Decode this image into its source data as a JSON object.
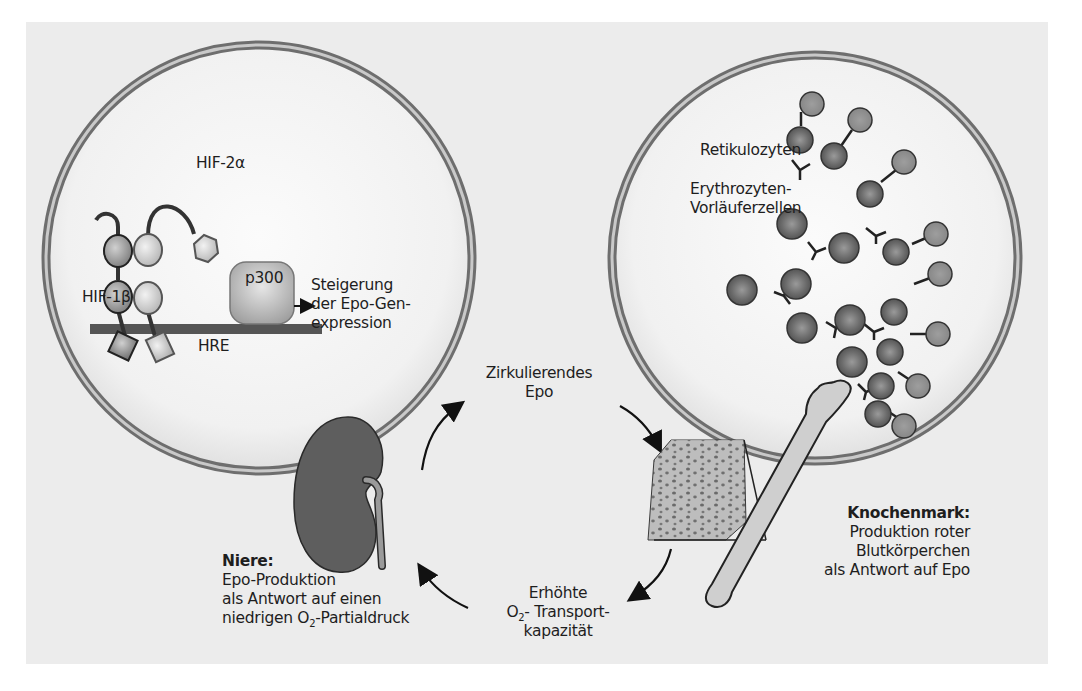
{
  "figure": {
    "background_color": "#ececec",
    "left_cell": {
      "labels": {
        "hif2a": "HIF-2α",
        "hif1b": "HIF-1β",
        "p300": "p300",
        "hre": "HRE",
        "expression_line1": "Steigerung",
        "expression_line2": "der Epo-Gen-",
        "expression_line3": "expression"
      }
    },
    "right_cell": {
      "labels": {
        "reticulocytes": "Retikulozyten",
        "precursors_line1": "Erythrozyten-",
        "precursors_line2": "Vorläuferzellen"
      }
    },
    "cycle": {
      "circulating_epo_line1": "Zirkulierendes",
      "circulating_epo_line2": "Epo",
      "capacity_line1": "Erhöhte",
      "capacity_o": "O",
      "capacity_sub": "2",
      "capacity_line2_rest": "- Transport-",
      "capacity_line3": "kapazität"
    },
    "kidney": {
      "title": "Niere:",
      "line1": "Epo-Produktion",
      "line2": "als Antwort auf einen",
      "line3_prefix": "niedrigen O",
      "line3_sub": "2",
      "line3_suffix": "-Partialdruck"
    },
    "bone_marrow": {
      "title": "Knochenmark:",
      "line1": "Produktion roter",
      "line2": "Blutkörperchen",
      "line3": "als Antwort auf Epo"
    },
    "colors": {
      "membrane": "#8a8a8a",
      "kidney": "#5e5e5e",
      "cell_dark": "#6a6a6a",
      "cell_light": "#8c8c8c",
      "text": "#1e1e1e"
    }
  }
}
